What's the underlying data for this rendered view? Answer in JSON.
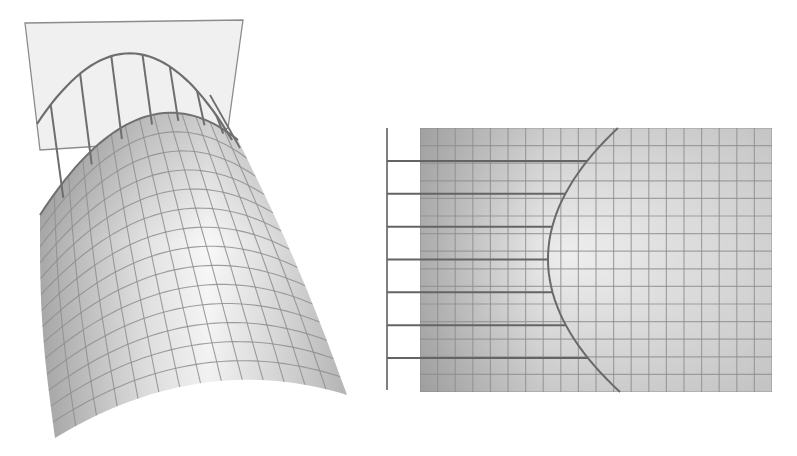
{
  "figure": {
    "colors": {
      "background": "#ffffff",
      "surface_light": "#f4f4f4",
      "surface_dark": "#b4b4b4",
      "grid_line": "#8a8a8a",
      "curve_line": "#6e6e6e",
      "plane_fill": "#efefef",
      "plane_edge": "#8c8c8c"
    },
    "left_view": {
      "name": "perspective-view",
      "plane_ribs": 7,
      "surface_grid_rows": 14,
      "surface_grid_cols": 14
    },
    "right_view": {
      "name": "top-view",
      "horizontal_lines": 7,
      "grid_rows": 15,
      "grid_cols": 20
    }
  }
}
